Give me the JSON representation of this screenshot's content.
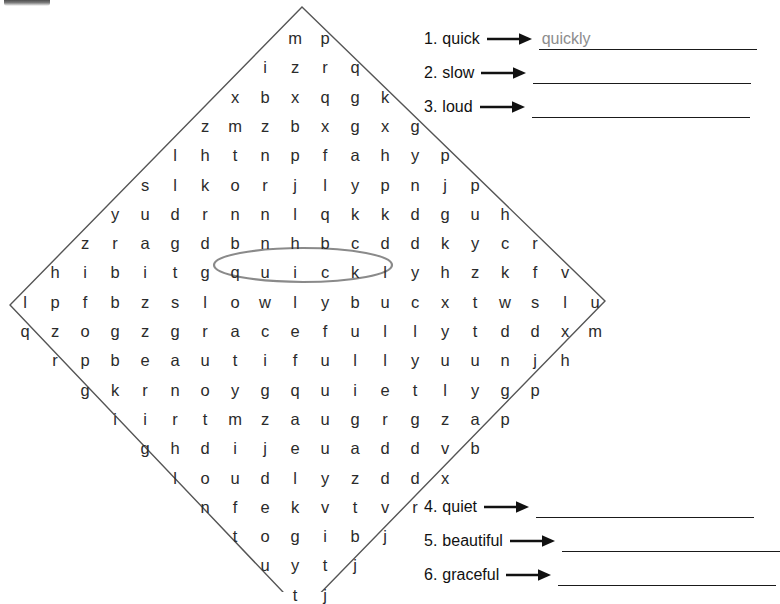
{
  "page": {
    "background_color": "#ffffff",
    "text_color": "#2b2b2b"
  },
  "puzzle": {
    "shape": "diamond",
    "outline_color": "#555555",
    "highlight": {
      "word": "quickly",
      "row_index": 8,
      "start_col": 6,
      "end_col": 12,
      "color": "#8a8a8a",
      "shape": "oval"
    },
    "rows": [
      [
        "m",
        "p"
      ],
      [
        "i",
        "z",
        "r",
        "q"
      ],
      [
        "x",
        "b",
        "x",
        "q",
        "g",
        "k"
      ],
      [
        "z",
        "m",
        "z",
        "b",
        "x",
        "g",
        "x",
        "g"
      ],
      [
        "l",
        "h",
        "t",
        "n",
        "p",
        "f",
        "a",
        "h",
        "y",
        "p"
      ],
      [
        "s",
        "l",
        "k",
        "o",
        "r",
        "j",
        "l",
        "y",
        "p",
        "n",
        "j",
        "p"
      ],
      [
        "y",
        "u",
        "d",
        "r",
        "n",
        "n",
        "l",
        "q",
        "k",
        "k",
        "d",
        "g",
        "u",
        "h"
      ],
      [
        "z",
        "r",
        "a",
        "g",
        "d",
        "b",
        "n",
        "h",
        "b",
        "c",
        "d",
        "d",
        "k",
        "y",
        "c",
        "r"
      ],
      [
        "h",
        "i",
        "b",
        "i",
        "t",
        "g",
        "q",
        "u",
        "i",
        "c",
        "k",
        "l",
        "y",
        "h",
        "z",
        "k",
        "f",
        "v"
      ],
      [
        "l",
        "p",
        "f",
        "b",
        "z",
        "s",
        "l",
        "o",
        "w",
        "l",
        "y",
        "b",
        "u",
        "c",
        "x",
        "t",
        "w",
        "s",
        "l",
        "u"
      ],
      [
        "q",
        "z",
        "o",
        "g",
        "z",
        "g",
        "r",
        "a",
        "c",
        "e",
        "f",
        "u",
        "l",
        "l",
        "y",
        "t",
        "d",
        "d",
        "x",
        "m"
      ],
      [
        "r",
        "p",
        "b",
        "e",
        "a",
        "u",
        "t",
        "i",
        "f",
        "u",
        "l",
        "l",
        "y",
        "u",
        "u",
        "n",
        "j",
        "h"
      ],
      [
        "g",
        "k",
        "r",
        "n",
        "o",
        "y",
        "g",
        "q",
        "u",
        "i",
        "e",
        "t",
        "l",
        "y",
        "g",
        "p"
      ],
      [
        "i",
        "i",
        "r",
        "t",
        "m",
        "z",
        "a",
        "u",
        "g",
        "r",
        "g",
        "z",
        "a",
        "p"
      ],
      [
        "g",
        "h",
        "d",
        "i",
        "j",
        "e",
        "u",
        "a",
        "d",
        "d",
        "v",
        "b"
      ],
      [
        "l",
        "o",
        "u",
        "d",
        "l",
        "y",
        "z",
        "d",
        "d",
        "x"
      ],
      [
        "n",
        "f",
        "e",
        "k",
        "v",
        "t",
        "v",
        "r"
      ],
      [
        "t",
        "o",
        "g",
        "i",
        "b",
        "j"
      ],
      [
        "u",
        "y",
        "t",
        "j"
      ],
      [
        "t",
        "j"
      ]
    ]
  },
  "word_list_top": {
    "items": [
      {
        "number": "1.",
        "word": "quick",
        "arrow": "right-arrow-icon",
        "answer": "quickly"
      },
      {
        "number": "2.",
        "word": "slow",
        "arrow": "right-arrow-icon",
        "answer": ""
      },
      {
        "number": "3.",
        "word": "loud",
        "arrow": "right-arrow-icon",
        "answer": ""
      }
    ]
  },
  "word_list_bottom": {
    "items": [
      {
        "number": "4.",
        "word": "quiet",
        "arrow": "right-arrow-icon",
        "answer": ""
      },
      {
        "number": "5.",
        "word": "beautiful",
        "arrow": "right-arrow-icon",
        "answer": ""
      },
      {
        "number": "6.",
        "word": "graceful",
        "arrow": "right-arrow-icon",
        "answer": ""
      }
    ]
  }
}
